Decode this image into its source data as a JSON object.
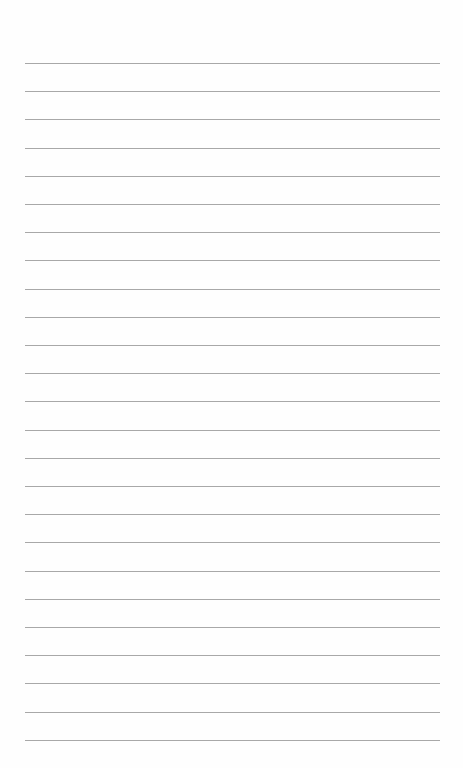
{
  "page": {
    "type": "lined-paper",
    "line_count": 25,
    "background_color": "#fefefe",
    "line_color": "#a8a8a8"
  }
}
